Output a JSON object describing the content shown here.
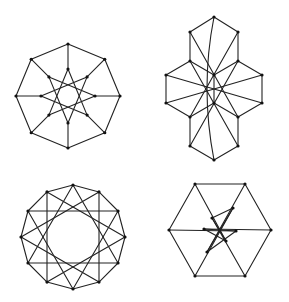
{
  "figure": {
    "width": 289,
    "height": 302,
    "background": "#ffffff",
    "stroke_color": "#222222",
    "vertex_color": "#111111",
    "vertex_radius": 1.6
  },
  "graphs": [
    {
      "name": "octagon-star-graph",
      "description": "Outer octagon with spokes to an inner 8-pointed star {8/3}",
      "position": "top-left",
      "center": [
        68,
        96
      ],
      "outer": {
        "count": 8,
        "radius": 52,
        "start_angle_deg": -90
      },
      "inner": {
        "count": 8,
        "radius": 27,
        "start_angle_deg": -90,
        "step": 3
      },
      "spokes": true
    },
    {
      "name": "three-hexagon-cluster-graph",
      "description": "Vertically stacked cluster of hexagonal cells with diagonal chords and a curved edge",
      "position": "top-right",
      "vertices": [
        [
          214,
          17
        ],
        [
          190,
          32
        ],
        [
          238,
          32
        ],
        [
          190,
          61
        ],
        [
          238,
          61
        ],
        [
          166,
          75
        ],
        [
          214,
          75
        ],
        [
          262,
          75
        ],
        [
          166,
          103
        ],
        [
          214,
          103
        ],
        [
          262,
          103
        ],
        [
          190,
          117
        ],
        [
          238,
          117
        ],
        [
          190,
          146
        ],
        [
          238,
          146
        ],
        [
          214,
          160
        ]
      ],
      "edges": [
        [
          0,
          1
        ],
        [
          0,
          2
        ],
        [
          1,
          3
        ],
        [
          2,
          4
        ],
        [
          3,
          5
        ],
        [
          3,
          6
        ],
        [
          4,
          6
        ],
        [
          4,
          7
        ],
        [
          5,
          8
        ],
        [
          6,
          9
        ],
        [
          7,
          10
        ],
        [
          8,
          11
        ],
        [
          9,
          11
        ],
        [
          9,
          12
        ],
        [
          10,
          12
        ],
        [
          11,
          13
        ],
        [
          12,
          14
        ],
        [
          13,
          15
        ],
        [
          14,
          15
        ],
        [
          1,
          12
        ],
        [
          2,
          11
        ],
        [
          5,
          10
        ],
        [
          7,
          8
        ],
        [
          3,
          14
        ],
        [
          4,
          13
        ]
      ],
      "curved_edges": [
        {
          "from": 0,
          "to": 15,
          "control": [
            200,
            88
          ]
        }
      ]
    },
    {
      "name": "dodecagon-chord-graph",
      "description": "12-gon with long chords forming an interlaced ring",
      "position": "bottom-left",
      "center": [
        73,
        237
      ],
      "outer": {
        "count": 12,
        "radius": 52,
        "start_angle_deg": -90
      },
      "chord_step": 4
    },
    {
      "name": "hexagon-twisted-star-graph",
      "description": "Outer hexagon with spokes to a small twisted inner star",
      "position": "bottom-right",
      "outer_vertices": [
        [
          195,
          184
        ],
        [
          245,
          184
        ],
        [
          271,
          230
        ],
        [
          245,
          276
        ],
        [
          195,
          276
        ],
        [
          169,
          230
        ]
      ],
      "inner_vertices": [
        [
          212,
          218
        ],
        [
          233,
          208
        ],
        [
          236,
          231
        ],
        [
          226,
          241
        ],
        [
          207,
          252
        ],
        [
          204,
          229
        ]
      ],
      "edges_outer_to_inner": [
        [
          0,
          3
        ],
        [
          1,
          4
        ],
        [
          2,
          5
        ],
        [
          3,
          0
        ],
        [
          4,
          1
        ],
        [
          5,
          2
        ]
      ],
      "inner_edges": [
        [
          0,
          1
        ],
        [
          1,
          4
        ],
        [
          4,
          2
        ],
        [
          2,
          5
        ],
        [
          5,
          3
        ],
        [
          3,
          0
        ]
      ]
    }
  ]
}
